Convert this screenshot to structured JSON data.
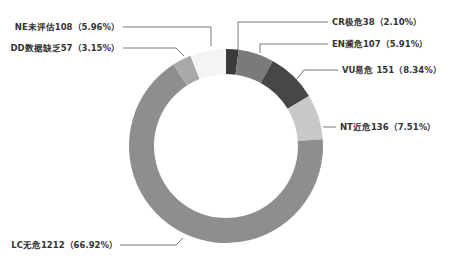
{
  "chart_data": {
    "type": "pie",
    "donut": true,
    "title": "",
    "categories": [
      "CR极危",
      "EN濒危",
      "VU易危",
      "NT近危",
      "LC无危",
      "DD数据缺乏",
      "NE未评估"
    ],
    "values": [
      38,
      107,
      151,
      136,
      1212,
      57,
      108
    ],
    "percentages": [
      2.1,
      5.91,
      8.34,
      7.51,
      66.92,
      3.15,
      5.96
    ],
    "colors": [
      "#3a3a3a",
      "#7a7a7a",
      "#474747",
      "#c8c8c8",
      "#8e8e8e",
      "#a8a8a8",
      "#f4f4f4"
    ],
    "labels": [
      "CR极危38（2.10%）",
      "EN濒危107（5.91%）",
      "VU易危 151（8.34%）",
      "NT近危136（7.51%）",
      "LC无危1212（66.92%）",
      "DD数据缺乏57（3.15%）",
      "NE未评估108（5.96%）"
    ],
    "legend": "none",
    "start_angle": "12 o'clock, clockwise"
  }
}
